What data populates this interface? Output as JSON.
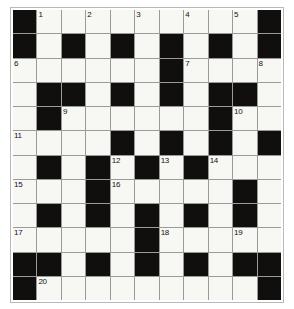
{
  "puzzle": {
    "kind": "crossword-grid",
    "columns": 11,
    "rows": 12,
    "colors": {
      "block": "#100f0d",
      "open": "#f7f7f4",
      "gridline": "#9a9a9a",
      "frame_border": "#b9b9b9",
      "page_background": "#ffffff",
      "number_text": "#111111"
    },
    "layout_legend": {
      "1": "open (white) cell",
      "0": "blocked (black) cell"
    },
    "layout": [
      [
        0,
        1,
        1,
        1,
        1,
        1,
        1,
        1,
        1,
        1,
        0
      ],
      [
        0,
        1,
        0,
        1,
        0,
        1,
        0,
        1,
        0,
        1,
        0
      ],
      [
        1,
        1,
        1,
        1,
        1,
        1,
        0,
        1,
        1,
        1,
        1
      ],
      [
        1,
        0,
        0,
        1,
        0,
        1,
        0,
        1,
        0,
        0,
        1
      ],
      [
        1,
        0,
        1,
        1,
        1,
        1,
        1,
        1,
        0,
        1,
        1
      ],
      [
        1,
        1,
        1,
        1,
        0,
        1,
        0,
        1,
        0,
        1,
        0
      ],
      [
        1,
        0,
        1,
        0,
        1,
        0,
        1,
        0,
        1,
        1,
        1
      ],
      [
        1,
        1,
        1,
        0,
        1,
        1,
        1,
        1,
        1,
        0,
        1
      ],
      [
        1,
        0,
        1,
        0,
        1,
        0,
        1,
        0,
        1,
        0,
        1
      ],
      [
        1,
        1,
        1,
        1,
        1,
        0,
        1,
        1,
        1,
        1,
        1
      ],
      [
        0,
        0,
        1,
        0,
        1,
        0,
        1,
        0,
        1,
        0,
        0
      ],
      [
        0,
        1,
        1,
        1,
        1,
        1,
        1,
        1,
        1,
        1,
        0
      ]
    ],
    "numbers": [
      {
        "label": "1",
        "row": 1,
        "col": 2
      },
      {
        "label": "2",
        "row": 1,
        "col": 4
      },
      {
        "label": "3",
        "row": 1,
        "col": 6
      },
      {
        "label": "4",
        "row": 1,
        "col": 8
      },
      {
        "label": "5",
        "row": 1,
        "col": 10
      },
      {
        "label": "6",
        "row": 3,
        "col": 1
      },
      {
        "label": "7",
        "row": 3,
        "col": 8
      },
      {
        "label": "8",
        "row": 3,
        "col": 11
      },
      {
        "label": "9",
        "row": 5,
        "col": 3
      },
      {
        "label": "10",
        "row": 5,
        "col": 10
      },
      {
        "label": "11",
        "row": 6,
        "col": 1
      },
      {
        "label": "12",
        "row": 7,
        "col": 5
      },
      {
        "label": "13",
        "row": 7,
        "col": 7
      },
      {
        "label": "14",
        "row": 7,
        "col": 9
      },
      {
        "label": "15",
        "row": 8,
        "col": 1
      },
      {
        "label": "16",
        "row": 8,
        "col": 5
      },
      {
        "label": "17",
        "row": 10,
        "col": 1
      },
      {
        "label": "18",
        "row": 10,
        "col": 7
      },
      {
        "label": "19",
        "row": 10,
        "col": 10
      },
      {
        "label": "20",
        "row": 12,
        "col": 2
      }
    ]
  }
}
